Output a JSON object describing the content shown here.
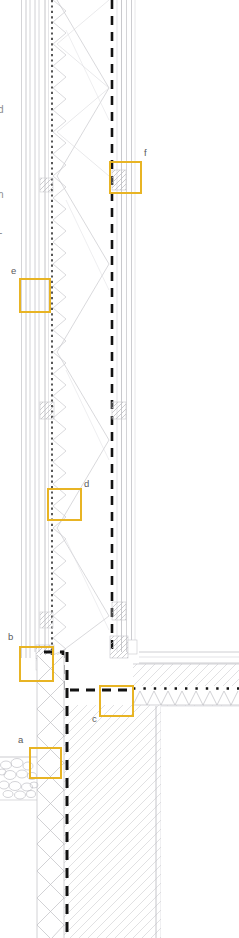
{
  "drawing": {
    "type": "architectural-wall-section-detail",
    "orientation": "vertical",
    "canvas": {
      "width": 239,
      "height": 938
    },
    "background_color": "#FFFFFF",
    "description": "Vertical building wall section through exterior wall, ground floor slab and basement wall with six highlighted callout zones labelled a through f"
  },
  "colors": {
    "callout_stroke": "#E8B424",
    "line_dark": "#1A1A1A",
    "line_mid": "#6E6E70",
    "line_light": "#B9B9BC",
    "hatch_light": "#CFCFD2",
    "hatch_faint": "#DEDEE1",
    "label_text": "#59595B",
    "edge_text": "#8A8A8C",
    "paper": "#FFFFFF"
  },
  "callouts": [
    {
      "id": "a",
      "label": "a",
      "label_x": 18,
      "label_y": 735,
      "box": {
        "x": 30,
        "y": 748,
        "w": 31,
        "h": 30
      },
      "zone": "basement-wall-to-gravel-backfill-junction"
    },
    {
      "id": "b",
      "label": "b",
      "label_x": 8,
      "label_y": 632,
      "box": {
        "x": 20,
        "y": 647,
        "w": 33,
        "h": 34
      },
      "zone": "wall-base-to-slab-edge-junction"
    },
    {
      "id": "c",
      "label": "c",
      "label_x": 92,
      "label_y": 714,
      "box": {
        "x": 100,
        "y": 686,
        "w": 33,
        "h": 30
      },
      "zone": "floor-slab-membrane-turn-up"
    },
    {
      "id": "d",
      "label": "d",
      "label_x": 84,
      "label_y": 479,
      "box": {
        "x": 48,
        "y": 489,
        "w": 33,
        "h": 31
      },
      "zone": "mid-wall-insulation-layer"
    },
    {
      "id": "e",
      "label": "e",
      "label_x": 11,
      "label_y": 266,
      "box": {
        "x": 20,
        "y": 279,
        "w": 30,
        "h": 33
      },
      "zone": "outer-cladding-rainscreen-layers"
    },
    {
      "id": "f",
      "label": "f",
      "label_x": 144,
      "label_y": 148,
      "box": {
        "x": 110,
        "y": 162,
        "w": 31,
        "h": 31
      },
      "zone": "inner-lining-airtight-layer-splice"
    }
  ],
  "edge_labels": [
    {
      "text": "d",
      "x": -2,
      "y": 105
    },
    {
      "text": "n",
      "x": -2,
      "y": 190
    },
    {
      "text": "-",
      "x": -1,
      "y": 228
    }
  ],
  "assembly": {
    "wall_layers": [
      {
        "name": "outer-cladding-face",
        "x": 21.5,
        "kind": "thin-line"
      },
      {
        "name": "cladding-batten-cavity",
        "x": 26.0,
        "kind": "thin-line"
      },
      {
        "name": "rainscreen-board",
        "x": 30.0,
        "kind": "thin-line"
      },
      {
        "name": "sheathing-board",
        "x": 35.0,
        "kind": "thin-line"
      },
      {
        "name": "sheathing-board-inner",
        "x": 39.0,
        "kind": "thin-line"
      },
      {
        "name": "breather-membrane",
        "x": 45.0,
        "kind": "thin-line"
      },
      {
        "name": "vapour-permeable-layer",
        "x": 51.5,
        "kind": "fine-dotted"
      },
      {
        "name": "insulation-core",
        "x": 60.0,
        "kind": "x-hatch-zone",
        "width": 52
      },
      {
        "name": "airtight-membrane",
        "x": 112.0,
        "kind": "heavy-dashed"
      },
      {
        "name": "service-void-lining",
        "x": 121.5,
        "kind": "thin-line"
      },
      {
        "name": "internal-board",
        "x": 126.5,
        "kind": "thin-line"
      },
      {
        "name": "internal-finish",
        "x": 131.5,
        "kind": "thin-line"
      }
    ],
    "basement": {
      "insulation_band": {
        "x": 38,
        "w": 27,
        "kind": "x-hatch"
      },
      "waterproof_membrane": {
        "x": 67,
        "kind": "heavy-dashed"
      },
      "concrete_wall": {
        "x": 70,
        "w": 86,
        "kind": "diagonal-hatch"
      }
    },
    "floor": {
      "screed": {
        "y": 660,
        "h": 18,
        "kind": "diagonal-hatch"
      },
      "separating_membrane": {
        "y": 688,
        "kind": "dotted-heavy"
      },
      "floor_insulation": {
        "y": 692,
        "h": 14,
        "kind": "x-hatch"
      },
      "slab": {
        "y": 706,
        "kind": "diagonal-hatch"
      }
    },
    "ground": {
      "gravel_backfill": {
        "x": 0,
        "y": 755,
        "w": 38,
        "h": 45,
        "kind": "stone-fill"
      },
      "ground_line_y": 755
    }
  }
}
